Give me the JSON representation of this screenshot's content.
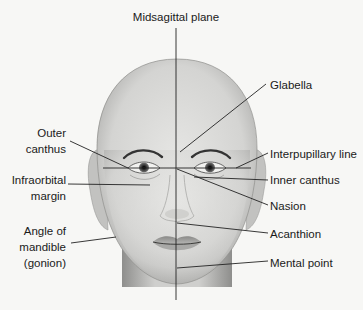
{
  "figure": {
    "title": "Midsagittal plane"
  },
  "labels": {
    "midsagittal": "Midsagittal plane",
    "glabella": "Glabella",
    "outer_canthus": [
      "Outer",
      "canthus"
    ],
    "interpupillary": "Interpupillary line",
    "infraorbital": [
      "Infraorbital",
      "margin"
    ],
    "inner_canthus": "Inner canthus",
    "nasion": "Nasion",
    "gonion": [
      "Angle of",
      "mandible",
      "(gonion)"
    ],
    "acanthion": "Acanthion",
    "mental_point": "Mental point"
  },
  "colors": {
    "background": "#f7f7f5",
    "skin_light": "#e4e4e2",
    "skin_mid": "#c9c9c7",
    "skin_dark": "#9a9a98",
    "line": "#222222",
    "text": "#1a1a1a"
  }
}
